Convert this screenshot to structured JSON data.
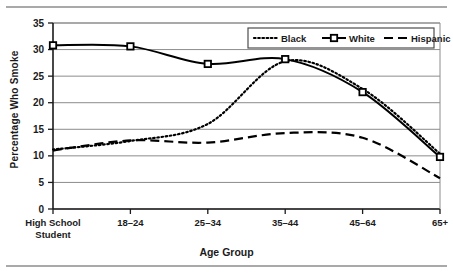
{
  "figure": {
    "rule_color": "#a9a9a9"
  },
  "chart_data": {
    "type": "line",
    "title": "",
    "xlabel": "Age Group",
    "ylabel": "Percentage Who Smoke",
    "categories": [
      "High School Student",
      "18–24",
      "25–34",
      "35–44",
      "45–64",
      "65+"
    ],
    "ylim": [
      0,
      35
    ],
    "ytick_step": 5,
    "yticks": [
      "0",
      "5",
      "10",
      "15",
      "20",
      "25",
      "30",
      "35"
    ],
    "grid": "horizontal",
    "legend_position": "top-right",
    "series": [
      {
        "name": "Black",
        "style": "dotted",
        "marker": "none",
        "color": "#000000",
        "values": [
          11.2,
          12.8,
          16.0,
          27.8,
          22.6,
          10.4
        ]
      },
      {
        "name": "White",
        "style": "solid",
        "marker": "square",
        "color": "#000000",
        "values": [
          30.8,
          30.6,
          27.3,
          28.2,
          22.0,
          9.8
        ]
      },
      {
        "name": "Hispanic",
        "style": "dashed",
        "marker": "none",
        "color": "#000000",
        "values": [
          11.0,
          12.9,
          12.5,
          14.3,
          13.4,
          5.8
        ]
      }
    ]
  }
}
